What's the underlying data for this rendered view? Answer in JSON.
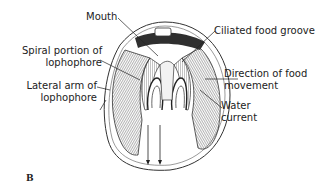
{
  "figure": {
    "panel_letter": "B"
  },
  "labels": {
    "mouth": "Mouth",
    "spiral_line1": "Spiral portion of",
    "spiral_line2": "lophophore",
    "lateral_line1": "Lateral arm of",
    "lateral_line2": "lophophore",
    "ciliated": "Ciliated food groove",
    "direction_line1": "Direction of food",
    "direction_line2": "movement",
    "water_line1": "Water",
    "water_line2": "current"
  },
  "colors": {
    "ink": "#222222",
    "background": "#ffffff",
    "dark_fill": "#3a3a3a",
    "mid_fill": "#9a9a9a"
  }
}
